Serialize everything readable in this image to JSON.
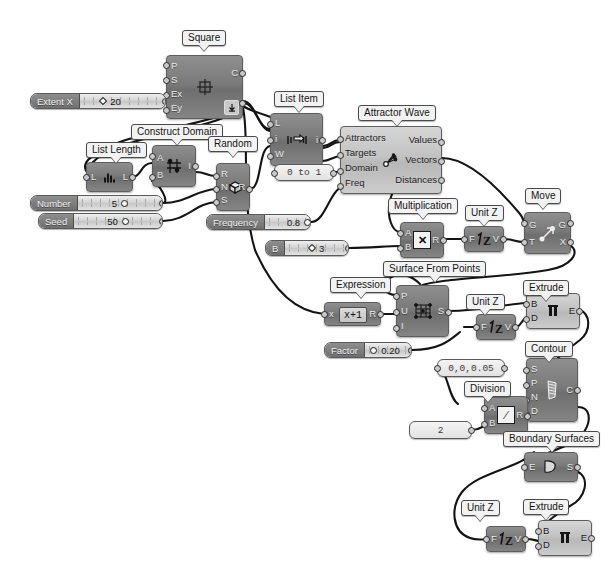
{
  "app": {
    "name": "Grasshopper Canvas",
    "background": "#ffffff",
    "wire_color": "#141414"
  },
  "nodes": [
    {
      "id": "square",
      "label": "Square",
      "inputs": [
        "P",
        "S",
        "Ex",
        "Ey"
      ],
      "outputs": [
        "C",
        "P"
      ],
      "icon": "square-grid-icon",
      "theme": "dark"
    },
    {
      "id": "list_length",
      "label": "List Length",
      "inputs": [
        "L"
      ],
      "outputs": [
        "L"
      ],
      "icon": "list-length-icon",
      "theme": "dark"
    },
    {
      "id": "construct_domain",
      "label": "Construct Domain",
      "inputs": [
        "A",
        "B"
      ],
      "outputs": [
        "I"
      ],
      "icon": "domain-icon",
      "theme": "dark"
    },
    {
      "id": "random",
      "label": "Random",
      "inputs": [
        "R",
        "N",
        "S"
      ],
      "outputs": [
        "R"
      ],
      "icon": "dice-icon",
      "theme": "dark"
    },
    {
      "id": "list_item",
      "label": "List Item",
      "inputs": [
        "L",
        "i",
        "W"
      ],
      "outputs": [
        "i"
      ],
      "icon": "list-item-icon",
      "theme": "dark"
    },
    {
      "id": "attractor_wave",
      "label": "Attractor Wave",
      "inputs": [
        "Attractors",
        "Targets",
        "Domain",
        "Freq"
      ],
      "outputs": [
        "Values",
        "Vectors",
        "Distances"
      ],
      "icon": "attractor-icon",
      "theme": "light"
    },
    {
      "id": "multiplication",
      "label": "Multiplication",
      "inputs": [
        "A",
        "B"
      ],
      "outputs": [
        "R"
      ],
      "icon": "multiply-icon",
      "theme": "dark"
    },
    {
      "id": "unit_z_1",
      "label": "Unit Z",
      "inputs": [
        "F"
      ],
      "outputs": [
        "V"
      ],
      "icon": "unit-z-icon",
      "theme": "dark"
    },
    {
      "id": "move",
      "label": "Move",
      "inputs": [
        "G",
        "T"
      ],
      "outputs": [
        "G",
        "X"
      ],
      "icon": "move-arrow-icon",
      "theme": "dark"
    },
    {
      "id": "expression",
      "label": "Expression",
      "inputs": [
        "x"
      ],
      "outputs": [
        "R"
      ],
      "icon": "expression-icon",
      "theme": "dark",
      "expression": "x+1"
    },
    {
      "id": "surface_from_points",
      "label": "Surface From Points",
      "inputs": [
        "P",
        "U",
        "I"
      ],
      "outputs": [
        "S"
      ],
      "icon": "surface-points-icon",
      "theme": "dark"
    },
    {
      "id": "unit_z_2",
      "label": "Unit Z",
      "inputs": [
        "F"
      ],
      "outputs": [
        "V"
      ],
      "icon": "unit-z-icon",
      "theme": "dark"
    },
    {
      "id": "extrude_1",
      "label": "Extrude",
      "inputs": [
        "B",
        "D"
      ],
      "outputs": [
        "E"
      ],
      "icon": "extrude-icon",
      "theme": "light"
    },
    {
      "id": "contour",
      "label": "Contour",
      "inputs": [
        "S",
        "P",
        "N",
        "D"
      ],
      "outputs": [
        "C"
      ],
      "icon": "contour-icon",
      "theme": "dark"
    },
    {
      "id": "division",
      "label": "Division",
      "inputs": [
        "A",
        "B"
      ],
      "outputs": [
        "R"
      ],
      "icon": "divide-icon",
      "theme": "dark"
    },
    {
      "id": "boundary_surfaces",
      "label": "Boundary Surfaces",
      "inputs": [
        "E"
      ],
      "outputs": [
        "S"
      ],
      "icon": "boundary-icon",
      "theme": "dark"
    },
    {
      "id": "extrude_2",
      "label": "Extrude",
      "inputs": [
        "B",
        "D"
      ],
      "outputs": [
        "E"
      ],
      "icon": "extrude-icon",
      "theme": "light"
    },
    {
      "id": "unit_z_3",
      "label": "Unit Z",
      "inputs": [
        "F"
      ],
      "outputs": [
        "V"
      ],
      "icon": "unit-z-icon",
      "theme": "dark"
    }
  ],
  "sliders": [
    {
      "id": "extent_x",
      "name": "Extent X",
      "value": "20",
      "handle": "diamond",
      "handle_side": "left"
    },
    {
      "id": "number",
      "name": "Number",
      "value": "5",
      "handle": "circle",
      "handle_side": "right"
    },
    {
      "id": "seed",
      "name": "Seed",
      "value": "50",
      "handle": "circle",
      "handle_side": "right"
    },
    {
      "id": "frequency",
      "name": "Frequency",
      "value": "0.8",
      "handle": "circle",
      "handle_side": "right"
    },
    {
      "id": "b_slider",
      "name": "B",
      "value": "3",
      "handle": "diamond",
      "handle_side": "left"
    },
    {
      "id": "factor",
      "name": "Factor",
      "value": "0.20",
      "handle": "circle",
      "handle_side": "left"
    }
  ],
  "panels": [
    {
      "id": "domain_panel",
      "text": "0 to 1"
    },
    {
      "id": "vector_panel",
      "text": "0,0,0.05"
    },
    {
      "id": "number_panel",
      "text": "2"
    }
  ]
}
